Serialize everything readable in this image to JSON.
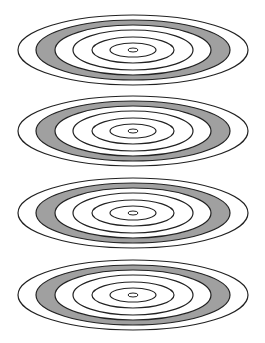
{
  "figure": {
    "type": "concentric-ellipse-sets",
    "set_count": 4,
    "center_x": 133,
    "centers_y": [
      50,
      131,
      213,
      295
    ],
    "stroke_color": "#222222",
    "band_fill_color": "#a0a0a0",
    "background_color": "#ffffff",
    "rings": [
      {
        "name": "outer",
        "rx": 115,
        "ry": 35,
        "fill": "none"
      },
      {
        "name": "band-outer",
        "rx": 97,
        "ry": 30,
        "fill": "band"
      },
      {
        "name": "band-inner",
        "rx": 78,
        "ry": 25,
        "fill": "white"
      },
      {
        "name": "ring-3",
        "rx": 60,
        "ry": 20,
        "fill": "none"
      },
      {
        "name": "ring-2",
        "rx": 41,
        "ry": 13,
        "fill": "none"
      },
      {
        "name": "ring-1",
        "rx": 23,
        "ry": 7,
        "fill": "none"
      },
      {
        "name": "center-dot",
        "rx": 5,
        "ry": 2,
        "fill": "none"
      }
    ]
  },
  "caption": {
    "visible": "cropped-illegible"
  }
}
